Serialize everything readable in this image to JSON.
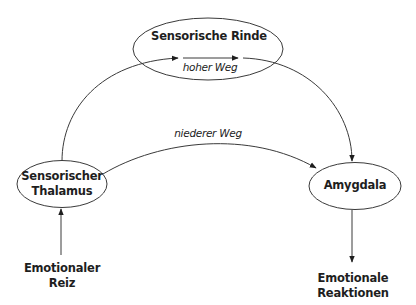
{
  "diagram": {
    "type": "flow",
    "nodes": [
      {
        "id": "rinde",
        "label": "Sensorische Rinde",
        "shape": "ellipse"
      },
      {
        "id": "thalamus",
        "label_line1": "Sensorischer",
        "label_line2": "Thalamus",
        "shape": "ellipse"
      },
      {
        "id": "amygdala",
        "label": "Amygdala",
        "shape": "ellipse"
      },
      {
        "id": "reiz",
        "label_line1": "Emotionaler",
        "label_line2": "Reiz",
        "shape": "text"
      },
      {
        "id": "reaktionen",
        "label_line1": "Emotionale",
        "label_line2": "Reaktionen",
        "shape": "text"
      }
    ],
    "edges": [
      {
        "from": "reiz",
        "to": "thalamus",
        "label": ""
      },
      {
        "from": "thalamus",
        "to": "rinde",
        "label": ""
      },
      {
        "from": "rinde",
        "to": "amygdala",
        "label": ""
      },
      {
        "from": "thalamus",
        "to": "amygdala",
        "label": "niederer Weg"
      },
      {
        "from": "amygdala",
        "to": "reaktionen",
        "label": ""
      }
    ],
    "high_road_label": "hoher Weg",
    "low_road_label": "niederer Weg",
    "colors": {
      "line": "#3a3a3a",
      "text": "#1e1e1e",
      "background": "#ffffff"
    }
  }
}
